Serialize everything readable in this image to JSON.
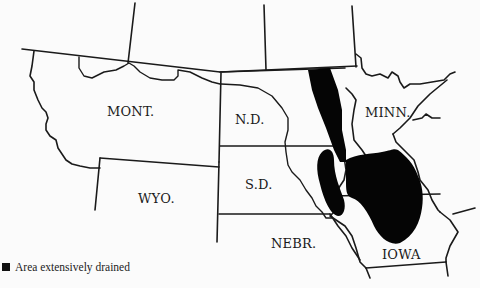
{
  "map": {
    "title": "",
    "labels": {
      "mont": "MONT.",
      "nd": "N.D.",
      "minn": "MINN.",
      "sd": "S.D.",
      "wyo": "WYO.",
      "nebr": "NEBR.",
      "iowa": "IOWA"
    },
    "legend": {
      "items": [
        {
          "symbol": "black-square",
          "label": "Area extensively drained",
          "color": "#111111"
        }
      ]
    },
    "colors": {
      "background": "#fbfbfb",
      "border": "#1a1a1a",
      "drained_area": "#050505"
    }
  }
}
